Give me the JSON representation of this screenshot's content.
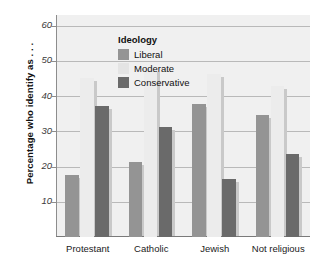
{
  "chart_data": {
    "type": "bar",
    "title": "",
    "subtitle": "",
    "xlabel": "",
    "ylabel": "Percentage who identify as . . .",
    "legend_title": "Ideology",
    "legend_position": "inside-top-left",
    "grid": true,
    "ylim": [
      0,
      63
    ],
    "yticks": [
      10,
      20,
      30,
      40,
      50,
      60
    ],
    "ytick_labels": [
      "10",
      "20",
      "30",
      "40",
      "50",
      "60"
    ],
    "categories": [
      "Protestant",
      "Catholic",
      "Jewish",
      "Not religious"
    ],
    "series": [
      {
        "name": "Liberal",
        "color": "#949494",
        "values": [
          17.5,
          21.3,
          37.8,
          34.5
        ]
      },
      {
        "name": "Moderate",
        "color": "#ececec",
        "values": [
          45.0,
          47.8,
          46.2,
          43.0
        ]
      },
      {
        "name": "Conservative",
        "color": "#6a6a6a",
        "values": [
          37.2,
          31.3,
          16.5,
          23.5
        ]
      }
    ],
    "annotations": []
  },
  "colors": {
    "plot_background": "#f0f0f0",
    "page_background": "#ffffff",
    "gridline": "#b9b9b9",
    "axis": "#7a7a7a",
    "shadow": "#c9c9c9",
    "text": "#111111"
  }
}
